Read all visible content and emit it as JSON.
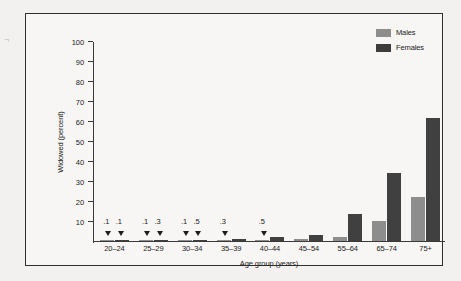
{
  "chart_data": {
    "type": "bar",
    "title": "",
    "xlabel": "Age group (years)",
    "ylabel": "Widowed (percent)",
    "ylim": [
      0,
      100
    ],
    "yticks": [
      10,
      20,
      30,
      40,
      50,
      60,
      70,
      80,
      90,
      100
    ],
    "grid": false,
    "legend_position": "top-right",
    "categories": [
      "20–24",
      "25–29",
      "30–34",
      "35–39",
      "40–44",
      "45–54",
      "55–64",
      "65–74",
      "75+"
    ],
    "series": [
      {
        "name": "Males",
        "color": "#8d8d8d",
        "values": [
          0.1,
          0.1,
          0.1,
          0.3,
          0.5,
          1.0,
          2.2,
          10.0,
          22.0
        ],
        "point_labels": [
          ".1",
          ".1",
          ".1",
          ".3",
          ".5",
          "",
          "",
          "",
          ""
        ]
      },
      {
        "name": "Females",
        "color": "#404040",
        "values": [
          0.1,
          0.3,
          0.5,
          1.0,
          1.8,
          3.2,
          13.5,
          34.0,
          61.5
        ],
        "point_labels": [
          ".1",
          ".3",
          ".5",
          "",
          "",
          "",
          "",
          "",
          ""
        ]
      }
    ]
  },
  "legend": {
    "items": [
      {
        "label": "Males"
      },
      {
        "label": "Females"
      }
    ]
  },
  "edge_mark": "¬"
}
